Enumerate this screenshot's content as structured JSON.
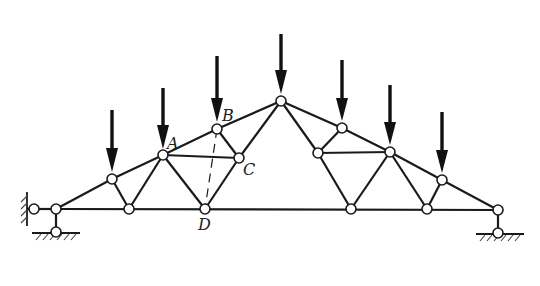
{
  "diagram": {
    "type": "truss",
    "labels": {
      "A": "A",
      "B": "B",
      "C": "C",
      "D": "D"
    },
    "nodes": {
      "support_left": [
        34,
        209
      ],
      "n0": [
        56,
        209
      ],
      "n0_ground": [
        56,
        232
      ],
      "t1": [
        112,
        179
      ],
      "A": [
        163,
        155
      ],
      "B": [
        217,
        129
      ],
      "apex": [
        281,
        101
      ],
      "t5": [
        342,
        128
      ],
      "t6": [
        390,
        152
      ],
      "t7": [
        442,
        180
      ],
      "n_end": [
        498,
        210
      ],
      "n_end_ground": [
        498,
        233
      ],
      "C": [
        239,
        158
      ],
      "R1": [
        318,
        153
      ],
      "b1": [
        129,
        209
      ],
      "D": [
        205,
        209
      ],
      "b3": [
        351,
        209
      ],
      "b4": [
        427,
        209
      ]
    },
    "loads": [
      {
        "node": "t1",
        "top": 110
      },
      {
        "node": "A",
        "top": 88
      },
      {
        "node": "B",
        "top": 56
      },
      {
        "node": "apex",
        "top": 34
      },
      {
        "node": "t5",
        "top": 60
      },
      {
        "node": "t6",
        "top": 85
      },
      {
        "node": "t7",
        "top": 112
      }
    ],
    "dashed_member": [
      "B",
      "D"
    ],
    "colors": {
      "line": "#1a1a1a",
      "node_fill": "#ffffff",
      "background": "#ffffff"
    }
  }
}
